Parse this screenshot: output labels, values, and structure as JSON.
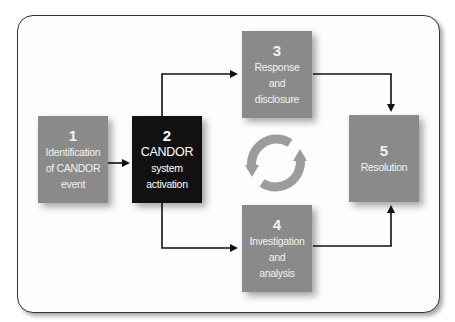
{
  "diagram": {
    "type": "process-flow",
    "colors": {
      "step_box": "#8a8a8a",
      "active_box": "#111111",
      "arrow": "#111111",
      "cycle_icon": "#9a9a9a",
      "frame_border": "#333333"
    },
    "steps": [
      {
        "number": "1",
        "lines": [
          "Identification",
          "of CANDOR",
          "event"
        ]
      },
      {
        "number": "2",
        "lines": [
          "CANDOR",
          "system",
          "activation"
        ]
      },
      {
        "number": "3",
        "lines": [
          "Response",
          "and",
          "disclosure"
        ]
      },
      {
        "number": "4",
        "lines": [
          "Investigation",
          "and",
          "analysis"
        ]
      },
      {
        "number": "5",
        "lines": [
          "Resolution"
        ]
      }
    ],
    "connections": [
      {
        "from": "1",
        "to": "2"
      },
      {
        "from": "2",
        "to": "3"
      },
      {
        "from": "2",
        "to": "4"
      },
      {
        "from": "3",
        "to": "5"
      },
      {
        "from": "4",
        "to": "5"
      }
    ],
    "center_icon": "cycle-arrows-icon"
  }
}
